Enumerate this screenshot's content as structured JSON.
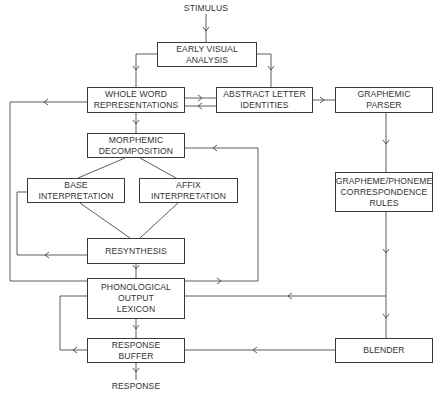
{
  "diagram": {
    "input_label": "STIMULUS",
    "output_label": "RESPONSE",
    "line_color": "#4a4a4a",
    "boxes": {
      "early_visual": {
        "lines": [
          "EARLY VISUAL",
          "ANALYSIS"
        ]
      },
      "whole_word": {
        "lines": [
          "WHOLE WORD",
          "REPRESENTATIONS"
        ]
      },
      "abstract_letter": {
        "lines": [
          "ABSTRACT LETTER",
          "IDENTITIES"
        ]
      },
      "graphemic_parser": {
        "lines": [
          "GRAPHEMIC",
          "PARSER"
        ]
      },
      "morphemic": {
        "lines": [
          "MORPHEMIC",
          "DECOMPOSITION"
        ]
      },
      "base": {
        "lines": [
          "BASE",
          "INTERPRETATION"
        ]
      },
      "affix": {
        "lines": [
          "AFFIX",
          "INTERPRETATION"
        ]
      },
      "gpc": {
        "lines": [
          "GRAPHEME/PHONEME",
          "CORRESPONDENCE",
          "RULES"
        ]
      },
      "resynthesis": {
        "lines": [
          "RESYNTHESIS"
        ]
      },
      "phonological": {
        "lines": [
          "PHONOLOGICAL",
          "OUTPUT",
          "LEXICON"
        ]
      },
      "response_buffer": {
        "lines": [
          "RESPONSE",
          "BUFFER"
        ]
      },
      "blender": {
        "lines": [
          "BLENDER"
        ]
      }
    },
    "edges": [
      {
        "from": "STIMULUS",
        "to": "EARLY VISUAL ANALYSIS"
      },
      {
        "from": "EARLY VISUAL ANALYSIS",
        "to": "WHOLE WORD REPRESENTATIONS"
      },
      {
        "from": "EARLY VISUAL ANALYSIS",
        "to": "ABSTRACT LETTER IDENTITIES"
      },
      {
        "from": "WHOLE WORD REPRESENTATIONS",
        "to": "ABSTRACT LETTER IDENTITIES"
      },
      {
        "from": "ABSTRACT LETTER IDENTITIES",
        "to": "WHOLE WORD REPRESENTATIONS"
      },
      {
        "from": "ABSTRACT LETTER IDENTITIES",
        "to": "GRAPHEMIC PARSER"
      },
      {
        "from": "WHOLE WORD REPRESENTATIONS",
        "to": "MORPHEMIC DECOMPOSITION"
      },
      {
        "from": "WHOLE WORD REPRESENTATIONS",
        "to": "PHONOLOGICAL OUTPUT LEXICON"
      },
      {
        "from": "MORPHEMIC DECOMPOSITION",
        "to": "BASE INTERPRETATION"
      },
      {
        "from": "MORPHEMIC DECOMPOSITION",
        "to": "AFFIX INTERPRETATION"
      },
      {
        "from": "BASE INTERPRETATION",
        "to": "RESYNTHESIS"
      },
      {
        "from": "AFFIX INTERPRETATION",
        "to": "RESYNTHESIS"
      },
      {
        "from": "RESYNTHESIS",
        "to": "BASE INTERPRETATION"
      },
      {
        "from": "RESYNTHESIS",
        "to": "PHONOLOGICAL OUTPUT LEXICON"
      },
      {
        "from": "PHONOLOGICAL OUTPUT LEXICON",
        "to": "MORPHEMIC DECOMPOSITION"
      },
      {
        "from": "GRAPHEMIC PARSER",
        "to": "GRAPHEME/PHONEME CORRESPONDENCE RULES"
      },
      {
        "from": "GRAPHEME/PHONEME CORRESPONDENCE RULES",
        "to": "PHONOLOGICAL OUTPUT LEXICON"
      },
      {
        "from": "GRAPHEME/PHONEME CORRESPONDENCE RULES",
        "to": "BLENDER"
      },
      {
        "from": "PHONOLOGICAL OUTPUT LEXICON",
        "to": "RESPONSE BUFFER"
      },
      {
        "from": "BLENDER",
        "to": "RESPONSE BUFFER"
      },
      {
        "from": "RESPONSE BUFFER",
        "to": "PHONOLOGICAL OUTPUT LEXICON"
      },
      {
        "from": "RESPONSE BUFFER",
        "to": "RESPONSE"
      }
    ]
  }
}
